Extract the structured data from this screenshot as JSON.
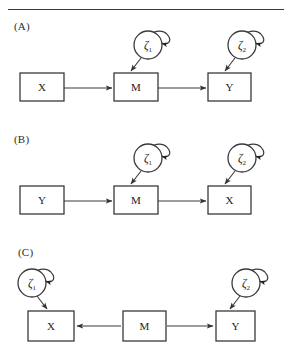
{
  "figure": {
    "type": "path-diagram",
    "background_color": "#ffffff",
    "line_color": "#3a3a3a",
    "text_color": "#1c1c1c",
    "has_top_rule": true
  },
  "panels": [
    {
      "id": "A",
      "label": "(A)",
      "label_x": 14,
      "label_y": 20,
      "boxes": [
        {
          "name": "box-x",
          "text": "X",
          "x": 20,
          "y": 73,
          "w": 44,
          "h": 28
        },
        {
          "name": "box-m",
          "text": "M",
          "x": 114,
          "y": 73,
          "w": 44,
          "h": 28
        },
        {
          "name": "box-y",
          "text": "Y",
          "x": 208,
          "y": 73,
          "w": 43,
          "h": 28
        }
      ],
      "circles": [
        {
          "name": "circle-zeta-1",
          "text": "ζ",
          "sub": "1",
          "cx": 148,
          "cy": 45,
          "r": 14
        },
        {
          "name": "circle-zeta-2",
          "text": "ζ",
          "sub": "2",
          "cx": 242,
          "cy": 45,
          "r": 14
        }
      ],
      "arrows": [
        {
          "name": "arrow-x-to-m",
          "x1": 64,
          "y1": 88,
          "x2": 112,
          "y2": 88
        },
        {
          "name": "arrow-m-to-y",
          "x1": 158,
          "y1": 88,
          "x2": 206,
          "y2": 88
        },
        {
          "name": "arrow-zeta1-to-m",
          "x1": 141,
          "y1": 58,
          "x2": 131,
          "y2": 71
        },
        {
          "name": "arrow-zeta2-to-y",
          "x1": 235,
          "y1": 58,
          "x2": 225,
          "y2": 71
        }
      ],
      "self_loops": [
        {
          "name": "self-loop-zeta-1",
          "cx": 148,
          "cy": 45,
          "r": 14
        },
        {
          "name": "self-loop-zeta-2",
          "cx": 242,
          "cy": 45,
          "r": 14
        }
      ]
    },
    {
      "id": "B",
      "label": "(B)",
      "label_x": 14,
      "label_y": 133,
      "boxes": [
        {
          "name": "box-y",
          "text": "Y",
          "x": 20,
          "y": 186,
          "w": 44,
          "h": 28
        },
        {
          "name": "box-m",
          "text": "M",
          "x": 114,
          "y": 186,
          "w": 44,
          "h": 28
        },
        {
          "name": "box-x",
          "text": "X",
          "x": 208,
          "y": 186,
          "w": 43,
          "h": 28
        }
      ],
      "circles": [
        {
          "name": "circle-zeta-1",
          "text": "ζ",
          "sub": "1",
          "cx": 148,
          "cy": 158,
          "r": 14
        },
        {
          "name": "circle-zeta-2",
          "text": "ζ",
          "sub": "2",
          "cx": 242,
          "cy": 158,
          "r": 14
        }
      ],
      "arrows": [
        {
          "name": "arrow-y-to-m",
          "x1": 64,
          "y1": 201,
          "x2": 112,
          "y2": 201
        },
        {
          "name": "arrow-m-to-x",
          "x1": 158,
          "y1": 201,
          "x2": 206,
          "y2": 201
        },
        {
          "name": "arrow-zeta1-to-m",
          "x1": 141,
          "y1": 171,
          "x2": 131,
          "y2": 184
        },
        {
          "name": "arrow-zeta2-to-x",
          "x1": 235,
          "y1": 171,
          "x2": 225,
          "y2": 184
        }
      ],
      "self_loops": [
        {
          "name": "self-loop-zeta-1",
          "cx": 148,
          "cy": 158,
          "r": 14
        },
        {
          "name": "self-loop-zeta-2",
          "cx": 242,
          "cy": 158,
          "r": 14
        }
      ]
    },
    {
      "id": "C",
      "label": "(C)",
      "label_x": 18,
      "label_y": 246,
      "boxes": [
        {
          "name": "box-x",
          "text": "X",
          "x": 28,
          "y": 311,
          "w": 46,
          "h": 30
        },
        {
          "name": "box-m",
          "text": "M",
          "x": 123,
          "y": 311,
          "w": 43,
          "h": 30
        },
        {
          "name": "box-y",
          "text": "Y",
          "x": 216,
          "y": 311,
          "w": 39,
          "h": 30
        }
      ],
      "circles": [
        {
          "name": "circle-zeta-1",
          "text": "ζ",
          "sub": "1",
          "cx": 32,
          "cy": 283,
          "r": 14
        },
        {
          "name": "circle-zeta-2",
          "text": "ζ",
          "sub": "2",
          "cx": 246,
          "cy": 283,
          "r": 14
        }
      ],
      "arrows": [
        {
          "name": "arrow-m-to-x",
          "x1": 121,
          "y1": 326,
          "x2": 77,
          "y2": 326
        },
        {
          "name": "arrow-m-to-y",
          "x1": 167,
          "y1": 326,
          "x2": 213,
          "y2": 326
        },
        {
          "name": "arrow-zeta1-to-x",
          "x1": 37,
          "y1": 296,
          "x2": 47,
          "y2": 309
        },
        {
          "name": "arrow-zeta2-to-y",
          "x1": 240,
          "y1": 296,
          "x2": 230,
          "y2": 309
        }
      ],
      "self_loops": [
        {
          "name": "self-loop-zeta-1",
          "cx": 32,
          "cy": 283,
          "r": 14
        },
        {
          "name": "self-loop-zeta-2",
          "cx": 246,
          "cy": 283,
          "r": 14
        }
      ]
    }
  ]
}
